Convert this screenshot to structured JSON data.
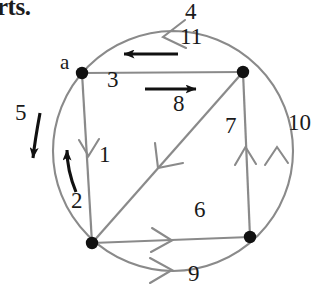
{
  "figure": {
    "partial_text_top_left": "rts.",
    "background_color": "#ffffff",
    "graph_line_color": "#8a8a8a",
    "circle_color": "#8a8a8a",
    "arrow_color": "#111111",
    "node_color": "#111111",
    "label_color": "#1a1a1a"
  },
  "vertices": [
    {
      "id": "top-left",
      "label": "a",
      "x": 82,
      "y": 73
    },
    {
      "id": "top-right",
      "label": "",
      "x": 243,
      "y": 72
    },
    {
      "id": "bottom-left",
      "label": "",
      "x": 92,
      "y": 243
    },
    {
      "id": "bottom-right",
      "label": "",
      "x": 250,
      "y": 237
    }
  ],
  "vertex_labels": {
    "a": "a"
  },
  "edge_labels": {
    "e1": "1",
    "e2": "2",
    "e3": "3",
    "e4": "4",
    "e5": "5",
    "e6": "6",
    "e7": "7",
    "e8": "8",
    "e9": "9",
    "e10": "10",
    "e11": "11"
  },
  "edges": [
    {
      "label": "1",
      "kind": "chord",
      "from": "top-left",
      "to": "bottom-left",
      "direction": "down",
      "marker": "thin-chevron"
    },
    {
      "label": "2",
      "kind": "curved-annotation",
      "direction": "up",
      "marker": "thick-arrow"
    },
    {
      "label": "3",
      "kind": "chord",
      "from": "top-left",
      "to": "top-right",
      "direction": "right",
      "marker": "thick-arrow"
    },
    {
      "label": "4",
      "kind": "arc",
      "from": "top-right",
      "to": "top-left",
      "direction": "left",
      "marker": "thin-chevron"
    },
    {
      "label": "5",
      "kind": "curved-annotation",
      "direction": "down",
      "marker": "thick-arrow"
    },
    {
      "label": "6",
      "kind": "chord",
      "from": "bottom-left",
      "to": "bottom-right",
      "direction": "right",
      "marker": "thin-chevron"
    },
    {
      "label": "7",
      "kind": "chord",
      "from": "bottom-right",
      "to": "top-right",
      "direction": "up",
      "marker": "thin-chevron"
    },
    {
      "label": "8",
      "kind": "chord",
      "from": "top-right",
      "to": "bottom-left",
      "direction": "down-left",
      "marker": "thin-chevron"
    },
    {
      "label": "9",
      "kind": "arc",
      "from": "bottom-left",
      "to": "bottom-right",
      "direction": "right",
      "marker": "thin-chevron"
    },
    {
      "label": "10",
      "kind": "arc",
      "from": "bottom-right",
      "to": "top-right",
      "direction": "up",
      "marker": "thin-chevron"
    },
    {
      "label": "11",
      "kind": "annotation",
      "direction": "left",
      "marker": "thick-arrow"
    }
  ],
  "label_positions": {
    "a": {
      "x": 60,
      "y": 62
    },
    "e1": {
      "x": 99,
      "y": 155
    },
    "e2": {
      "x": 71,
      "y": 201
    },
    "e3": {
      "x": 107,
      "y": 80
    },
    "e4": {
      "x": 185,
      "y": 10
    },
    "e5": {
      "x": 15,
      "y": 113
    },
    "e6": {
      "x": 194,
      "y": 209
    },
    "e7": {
      "x": 225,
      "y": 126
    },
    "e8": {
      "x": 173,
      "y": 103
    },
    "e9": {
      "x": 188,
      "y": 272
    },
    "e10": {
      "x": 288,
      "y": 123
    },
    "e11": {
      "x": 180,
      "y": 37
    }
  }
}
